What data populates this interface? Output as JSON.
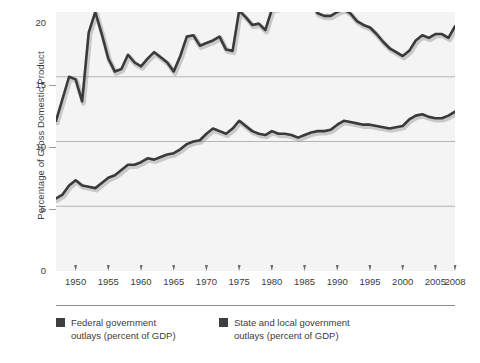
{
  "chart_data": {
    "type": "line",
    "title": "",
    "xlabel": "",
    "ylabel": "Percentage of Gross Domestic Product",
    "xlim": [
      1947,
      2008
    ],
    "ylim": [
      0,
      20
    ],
    "grid": true,
    "legend_position": "bottom",
    "y_ticks": [
      0,
      5,
      10,
      15,
      20
    ],
    "x_ticks": [
      1950,
      1955,
      1960,
      1965,
      1970,
      1975,
      1980,
      1985,
      1990,
      1995,
      2000,
      2005,
      2008
    ],
    "x": [
      1947,
      1948,
      1949,
      1950,
      1951,
      1952,
      1953,
      1954,
      1955,
      1956,
      1957,
      1958,
      1959,
      1960,
      1961,
      1962,
      1963,
      1964,
      1965,
      1966,
      1967,
      1968,
      1969,
      1970,
      1971,
      1972,
      1973,
      1974,
      1975,
      1976,
      1977,
      1978,
      1979,
      1980,
      1981,
      1982,
      1983,
      1984,
      1985,
      1986,
      1987,
      1988,
      1989,
      1990,
      1991,
      1992,
      1993,
      1994,
      1995,
      1996,
      1997,
      1998,
      1999,
      2000,
      2001,
      2002,
      2003,
      2004,
      2005,
      2006,
      2007,
      2008
    ],
    "series": [
      {
        "name": "Federal government outlays (percent of GDP)",
        "color": "#3a3a3a",
        "values": [
          11.6,
          13.3,
          15.0,
          14.8,
          13.1,
          18.4,
          20.0,
          18.3,
          16.4,
          15.4,
          15.6,
          16.7,
          16.1,
          15.8,
          16.4,
          16.9,
          16.5,
          16.1,
          15.4,
          16.6,
          18.1,
          18.2,
          17.4,
          17.6,
          17.8,
          18.1,
          17.1,
          17.0,
          20.1,
          19.6,
          19.0,
          19.1,
          18.6,
          20.2,
          20.3,
          21.5,
          21.6,
          20.6,
          21.1,
          20.7,
          19.9,
          19.7,
          19.7,
          20.0,
          20.2,
          19.9,
          19.3,
          19.0,
          18.8,
          18.3,
          17.7,
          17.2,
          16.9,
          16.6,
          17.0,
          17.8,
          18.2,
          18.0,
          18.3,
          18.3,
          18.0,
          18.9
        ]
      },
      {
        "name": "State and local government outlays (percent of GDP)",
        "color": "#3a3a3a",
        "values": [
          5.6,
          5.9,
          6.6,
          7.0,
          6.6,
          6.5,
          6.4,
          6.8,
          7.2,
          7.4,
          7.8,
          8.2,
          8.2,
          8.4,
          8.7,
          8.6,
          8.8,
          9.0,
          9.1,
          9.4,
          9.8,
          10.0,
          10.1,
          10.6,
          11.0,
          10.8,
          10.6,
          11.0,
          11.6,
          11.2,
          10.8,
          10.6,
          10.5,
          10.8,
          10.6,
          10.6,
          10.5,
          10.3,
          10.5,
          10.7,
          10.8,
          10.8,
          10.9,
          11.3,
          11.6,
          11.5,
          11.4,
          11.3,
          11.3,
          11.2,
          11.1,
          11.0,
          11.1,
          11.2,
          11.7,
          12.0,
          12.1,
          11.9,
          11.8,
          11.8,
          12.0,
          12.3
        ]
      }
    ]
  },
  "axes": {
    "y_title": "Percentage of Gross Domestic Product",
    "y_tick_labels": [
      "20",
      "15",
      "10",
      "5",
      "0"
    ],
    "x_tick_labels": [
      "1950",
      "1955",
      "1960",
      "1965",
      "1970",
      "1975",
      "1980",
      "1985",
      "1990",
      "1995",
      "2000",
      "2005",
      "2008"
    ]
  },
  "legend": {
    "items": [
      {
        "label": "Federal government\noutlays (percent of GDP)",
        "color": "#3f3f3f"
      },
      {
        "label": "State and local government\noutlays (percent of GDP)",
        "color": "#3f3f3f"
      }
    ]
  },
  "colors": {
    "plot_background": "#f4f4f4",
    "page_background": "#ffffff",
    "gridline": "#a5a5a5",
    "line": "#3a3a3a",
    "text": "#3c3c3c",
    "tick_mark": "#6d6d6d",
    "legend_rule": "#8e8e8e"
  }
}
